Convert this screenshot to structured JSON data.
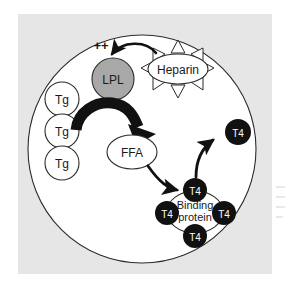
{
  "figure": {
    "panel_background": "#e6e6e6",
    "cell_fill": "#ffffff",
    "page_background": "#ffffff",
    "stroke_color": "#2b2b2b",
    "arrow_color": "#111111",
    "lpl_fill": "#a8a8a8",
    "t4_fill": "#111111",
    "t4_text_color": "#ffffff"
  },
  "nodes": {
    "activation_symbol": "++",
    "lpl": {
      "label": "LPL",
      "shape": "circle",
      "fill": "#a8a8a8"
    },
    "heparin": {
      "label": "Heparin",
      "shape": "ellipse",
      "spikes": 8
    },
    "ffa": {
      "label": "FFA",
      "shape": "ellipse"
    },
    "binding_protein": {
      "label_line1": "Binding",
      "label_line2": "protein",
      "shape": "ellipse"
    },
    "triglycerides": [
      {
        "label": "Tg"
      },
      {
        "label": "Tg"
      },
      {
        "label": "Tg"
      }
    ],
    "bound_thyroxine": [
      {
        "label": "T4",
        "position": "top"
      },
      {
        "label": "T4",
        "position": "left"
      },
      {
        "label": "T4",
        "position": "right"
      },
      {
        "label": "T4",
        "position": "bottom"
      }
    ],
    "free_thyroxine": {
      "label": "T4",
      "position": "upper-right"
    }
  },
  "arrows": [
    {
      "name": "heparin-activates-lpl",
      "from": "heparin",
      "to": "lpl",
      "style": "thin-curved"
    },
    {
      "name": "lpl-cleaves-tg-to-ffa",
      "from": "triglycerides",
      "to": "ffa",
      "style": "thick-curved"
    },
    {
      "name": "ffa-displaces-t4",
      "from": "ffa",
      "to": "bound-thyroxine-top",
      "style": "thin-curved"
    },
    {
      "name": "t4-released-free",
      "from": "bound-thyroxine-top",
      "to": "free-thyroxine",
      "style": "thin-curved"
    }
  ]
}
